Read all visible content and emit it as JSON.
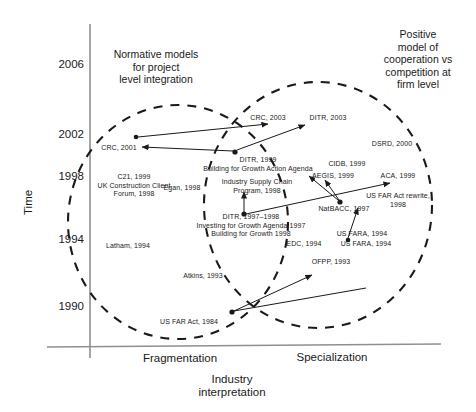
{
  "figure": {
    "type": "scatter-timeline-venn",
    "background": "#ffffff",
    "line_color": "#1a1a1a",
    "axis_color": "#8a8a8a"
  },
  "axes": {
    "y": {
      "label": "Time",
      "ticks": [
        "2006",
        "2002",
        "1998",
        "1994",
        "1990"
      ],
      "tick_y_px": [
        65,
        135,
        177,
        240,
        307
      ]
    },
    "x": {
      "label_line1": "Industry",
      "label_line2": "interpretation",
      "categories": [
        "Fragmentation",
        "Specialization"
      ]
    }
  },
  "regions": [
    {
      "id": "left-ellipse",
      "title": "Normative models\nfor project\nlevel integration"
    },
    {
      "id": "right-ellipse",
      "title": "Positive\nmodel of\ncooperation vs\ncompetition at\nfirm level"
    }
  ],
  "nodes": [
    {
      "id": "crc2001",
      "text": "CRC, 2001"
    },
    {
      "id": "crc2003",
      "text": "CRC, 2003"
    },
    {
      "id": "ditr2003",
      "text": "DITR, 2003"
    },
    {
      "id": "dsrd2000",
      "text": "DSRD, 2000"
    },
    {
      "id": "c21",
      "text": "C21, 1999\nUK Construction Client\nForum, 1998"
    },
    {
      "id": "ditr1999",
      "text": "DITR, 1999\nBuilding for Growth Action Agenda"
    },
    {
      "id": "cidb1999",
      "text": "CIDB, 1999"
    },
    {
      "id": "aegis1999",
      "text": "AEGIS, 1999"
    },
    {
      "id": "aca1999",
      "text": "ACA, 1999"
    },
    {
      "id": "egan1998",
      "text": "Egan, 1998"
    },
    {
      "id": "iscp1998",
      "text": "Industry Supply Chain\nProgram, 1998"
    },
    {
      "id": "usfar1998",
      "text": "US FAR Act rewrite,\n1998"
    },
    {
      "id": "natbacc",
      "text": "NatBACC, 1997"
    },
    {
      "id": "ditr9798",
      "text": "DITR, 1997–1998\nInvesting for Growth Agenda 1997\nBuilding for Growth 1998"
    },
    {
      "id": "latham",
      "text": "Latham, 1994"
    },
    {
      "id": "edc1994",
      "text": "EDC, 1994"
    },
    {
      "id": "usfara_a",
      "text": "US FARA, 1994"
    },
    {
      "id": "usfara_b",
      "text": "US FARA, 1994"
    },
    {
      "id": "atkins",
      "text": "Atkins, 1993"
    },
    {
      "id": "ofpp1993",
      "text": "OFPP, 1993"
    },
    {
      "id": "usfar1984",
      "text": "US FAR Act, 1984"
    }
  ]
}
